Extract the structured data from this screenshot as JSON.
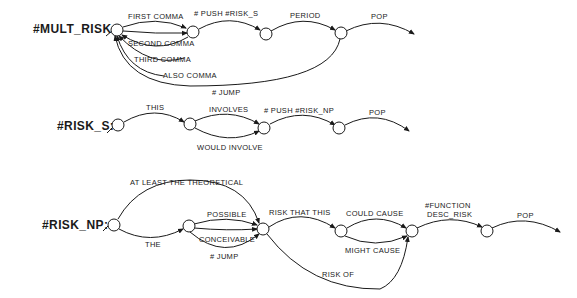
{
  "networks": [
    {
      "name": "#MULT_RISK:",
      "labels": {
        "first_comma": "FIRST COMMA",
        "second_comma": "SECOND COMMA",
        "third_comma": "THIRD COMMA",
        "also_comma": "ALSO COMMA",
        "push": "# PUSH #RISK_S",
        "period": "PERIOD",
        "jump": "# JUMP",
        "pop": "POP"
      }
    },
    {
      "name": "#RISK_S:",
      "labels": {
        "this": "THIS",
        "involves": "INVOLVES",
        "would_involve": "WOULD INVOLVE",
        "push": "# PUSH #RISK_NP",
        "pop": "POP"
      }
    },
    {
      "name": "#RISK_NP:",
      "labels": {
        "at_least": "AT LEAST THE THEORETICAL",
        "the": "THE",
        "possible": "POSSIBLE",
        "conceivable": "CONCEIVABLE",
        "jump": "# JUMP",
        "risk_that_this": "RISK THAT THIS",
        "could_cause": "COULD CAUSE",
        "might_cause": "MIGHT CAUSE",
        "risk_of": "RISK OF",
        "function_1": "#FUNCTION",
        "function_2": "DESC_RISK",
        "pop": "POP"
      }
    }
  ],
  "colors": {
    "ink": "#1a1a1a",
    "background": "#ffffff"
  }
}
